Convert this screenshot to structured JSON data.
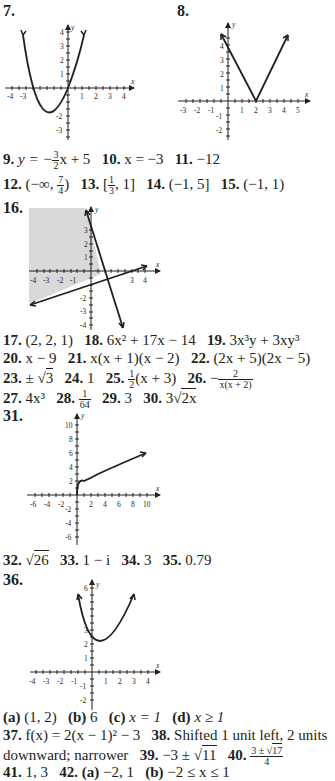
{
  "problems": {
    "p7": {
      "label": "7."
    },
    "p8": {
      "label": "8."
    },
    "p9": {
      "label": "9.",
      "lhs": "y = −",
      "frac_n": "3",
      "frac_d": "2",
      "rhs": "x + 5"
    },
    "p10": {
      "label": "10.",
      "answer": "x = −3"
    },
    "p11": {
      "label": "11.",
      "answer": "−12"
    },
    "p12": {
      "label": "12.",
      "pre": "(−∞, ",
      "frac_n": "7",
      "frac_d": "4",
      "post": ")"
    },
    "p13": {
      "label": "13.",
      "pre": "[",
      "frac_n": "1",
      "frac_d": "3",
      "post": ", 1]"
    },
    "p14": {
      "label": "14.",
      "answer": "(−1, 5]"
    },
    "p15": {
      "label": "15.",
      "answer": "(−1, 1)"
    },
    "p16": {
      "label": "16."
    },
    "p17": {
      "label": "17.",
      "answer": "(2, 2, 1)"
    },
    "p18": {
      "label": "18.",
      "answer": "6x² + 17x − 14"
    },
    "p19": {
      "label": "19.",
      "answer": "3x³y + 3xy³"
    },
    "p20": {
      "label": "20.",
      "answer": "x − 9"
    },
    "p21": {
      "label": "21.",
      "answer": "x(x + 1)(x − 2)"
    },
    "p22": {
      "label": "22.",
      "answer": "(2x + 5)(2x − 5)"
    },
    "p23": {
      "label": "23.",
      "pre": "± ",
      "radicand": "3"
    },
    "p24": {
      "label": "24.",
      "answer": "1"
    },
    "p25": {
      "label": "25.",
      "frac_n": "1",
      "frac_d": "2",
      "post": "(x + 3)"
    },
    "p26": {
      "label": "26.",
      "sign": "−",
      "frac_n": "2",
      "frac_d": "x(x + 2)"
    },
    "p27": {
      "label": "27.",
      "answer": "4x³"
    },
    "p28": {
      "label": "28.",
      "frac_n": "1",
      "frac_d": "64"
    },
    "p29": {
      "label": "29.",
      "answer": "3"
    },
    "p30": {
      "label": "30.",
      "pre": "3",
      "radicand": "2x"
    },
    "p31": {
      "label": "31."
    },
    "p32": {
      "label": "32.",
      "radicand": "26"
    },
    "p33": {
      "label": "33.",
      "answer": "1 − i"
    },
    "p34": {
      "label": "34.",
      "answer": "3"
    },
    "p35": {
      "label": "35.",
      "answer": "0.79"
    },
    "p36": {
      "label": "36.",
      "parts": [
        {
          "label": "(a)",
          "answer": "(1, 2)"
        },
        {
          "label": "(b)",
          "answer": "6"
        },
        {
          "label": "(c)",
          "answer": "x = 1"
        },
        {
          "label": "(d)",
          "answer": "x ≥ 1"
        }
      ]
    },
    "p37": {
      "label": "37.",
      "answer": "f(x) = 2(x − 1)² − 3"
    },
    "p38": {
      "label": "38.",
      "answer_line1": "Shifted 1 unit left, 2 units",
      "answer_line2": "downward; narrower"
    },
    "p39": {
      "label": "39.",
      "pre": "−3 ± ",
      "radicand": "11"
    },
    "p40": {
      "label": "40.",
      "frac_n_pre": "3 ± ",
      "frac_n_rad": "17",
      "frac_d": "4"
    },
    "p41": {
      "label": "41.",
      "answer": "1, 3"
    },
    "p42": {
      "label": "42.",
      "parts": [
        {
          "label": "(a)",
          "answer": "−2, 1"
        },
        {
          "label": "(b)",
          "answer": "−2 ≤ x ≤ 1"
        }
      ]
    }
  },
  "graphs": {
    "g7": {
      "xlabel": "x",
      "ylabel": "y",
      "xticks": [
        "-4",
        "-3",
        "1",
        "2",
        "3",
        "4"
      ],
      "yticks": [
        "4",
        "3",
        "2",
        "1",
        "-2",
        "-3",
        "-4"
      ],
      "curve": "y = x^2 + 2x"
    },
    "g8": {
      "xlabel": "x",
      "ylabel": "y",
      "xticks": [
        "-3",
        "-2",
        "-1",
        "1",
        "2",
        "3",
        "4",
        "5"
      ],
      "yticks": [
        "4",
        "3",
        "2",
        "1",
        "-1",
        "-2",
        "-3"
      ],
      "curve": "y = 2|x - 2|"
    },
    "g16": {
      "xlabel": "x",
      "ylabel": "y",
      "xticks": [
        "-4",
        "-3",
        "-2",
        "-1",
        "3",
        "4"
      ],
      "yticks": [
        "3",
        "2",
        "1",
        "-2",
        "-3",
        "-4"
      ],
      "shade": "#d9d9d9"
    },
    "g31": {
      "xlabel": "x",
      "ylabel": "y",
      "xticks": [
        "-6",
        "-4",
        "-2",
        "2",
        "4",
        "6",
        "8",
        "10"
      ],
      "yticks": [
        "10",
        "8",
        "6",
        "4",
        "2",
        "-2",
        "-4",
        "-6"
      ],
      "curve": "y = 2√x"
    },
    "g36": {
      "xlabel": "x",
      "ylabel": "y",
      "xticks": [
        "-4",
        "-3",
        "-2",
        "-1",
        "1",
        "2",
        "3",
        "4"
      ],
      "yticks": [
        "6",
        "3",
        "2",
        "1",
        "-1",
        "-2"
      ],
      "curve": "y = (x - 1)^2 + 2"
    }
  }
}
